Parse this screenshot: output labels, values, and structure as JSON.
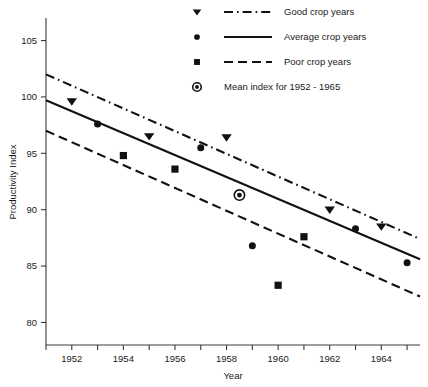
{
  "chart_data": {
    "type": "scatter",
    "title": "",
    "xlabel": "Year",
    "ylabel": "Productivity Index",
    "xlim": [
      1951,
      1965.5
    ],
    "ylim": [
      78,
      107
    ],
    "grid": false,
    "x_ticks": [
      1951,
      1952,
      1953,
      1954,
      1955,
      1956,
      1957,
      1958,
      1959,
      1960,
      1961,
      1962,
      1963,
      1964,
      1965
    ],
    "x_tick_labels": [
      "",
      "1952",
      "",
      "1954",
      "",
      "1956",
      "",
      "1958",
      "",
      "1960",
      "",
      "1962",
      "",
      "1964",
      ""
    ],
    "y_ticks": [
      80,
      85,
      90,
      95,
      100,
      105
    ],
    "y_tick_labels": [
      "80",
      "85",
      "90",
      "95",
      "100",
      "105"
    ],
    "legend_position": "top-right",
    "series": [
      {
        "name": "Good crop years",
        "marker": "triangle-down",
        "linestyle": "dash-dot",
        "points": [
          {
            "x": 1952,
            "y": 99.6
          },
          {
            "x": 1955,
            "y": 96.5
          },
          {
            "x": 1958,
            "y": 96.4
          },
          {
            "x": 1962,
            "y": 90.0
          },
          {
            "x": 1964,
            "y": 88.5
          }
        ],
        "trend_endpoints": [
          {
            "x": 1951,
            "y": 102.0
          },
          {
            "x": 1965.5,
            "y": 87.4
          }
        ]
      },
      {
        "name": "Average crop years",
        "marker": "circle",
        "linestyle": "solid",
        "points": [
          {
            "x": 1953,
            "y": 97.6
          },
          {
            "x": 1957,
            "y": 95.5
          },
          {
            "x": 1959,
            "y": 86.8
          },
          {
            "x": 1963,
            "y": 88.3
          },
          {
            "x": 1965,
            "y": 85.3
          }
        ],
        "trend_endpoints": [
          {
            "x": 1951,
            "y": 99.7
          },
          {
            "x": 1965.5,
            "y": 85.6
          }
        ]
      },
      {
        "name": "Poor crop years",
        "marker": "square",
        "linestyle": "dashed",
        "points": [
          {
            "x": 1954,
            "y": 94.8
          },
          {
            "x": 1956,
            "y": 93.6
          },
          {
            "x": 1960,
            "y": 83.3
          },
          {
            "x": 1961,
            "y": 87.6
          }
        ],
        "trend_endpoints": [
          {
            "x": 1951,
            "y": 97.0
          },
          {
            "x": 1965.5,
            "y": 82.3
          }
        ]
      },
      {
        "name": "Mean index for 1952 - 1965",
        "marker": "circled-dot",
        "linestyle": "none",
        "points": [
          {
            "x": 1958.5,
            "y": 91.3
          }
        ]
      }
    ]
  },
  "legend": {
    "items": [
      {
        "label": "Good crop years",
        "marker": "triangle-down",
        "linestyle": "dash-dot"
      },
      {
        "label": "Average crop years",
        "marker": "circle",
        "linestyle": "solid"
      },
      {
        "label": "Poor crop years",
        "marker": "square",
        "linestyle": "dashed"
      },
      {
        "label": "Mean index for 1952 - 1965",
        "marker": "circled-dot",
        "linestyle": "none"
      }
    ]
  },
  "colors": {
    "ink": "#111111",
    "axis": "#3a3a3a",
    "background": "#ffffff"
  }
}
